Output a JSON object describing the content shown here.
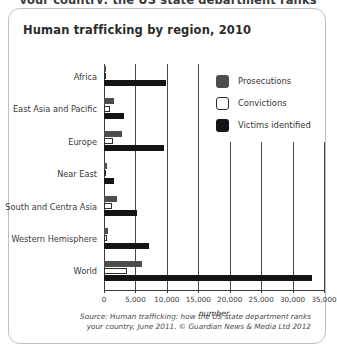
{
  "top_clipped_text": "your country: the US state department ranks",
  "card": {
    "title": "Human trafficking by region, 2010",
    "source_line1": "Source: Human trafficking: how the US state department ranks",
    "source_line2": "your country, June 2011. © Guardian News & Media Ltd 2012"
  },
  "legend": {
    "items": [
      {
        "label": "Prosecutions",
        "swatch": "prosecutions-swatch",
        "color": "#4d4d4d"
      },
      {
        "label": "Convictions",
        "swatch": "convictions-swatch",
        "color": "#ffffff"
      },
      {
        "label": "Victims identified",
        "swatch": "victims-swatch",
        "color": "#141414"
      }
    ]
  },
  "chart_data": {
    "type": "bar",
    "orientation": "horizontal",
    "title": "Human trafficking by region, 2010",
    "xlabel": "number",
    "ylabel": "",
    "xlim": [
      0,
      35000
    ],
    "xticks": [
      0,
      5000,
      10000,
      15000,
      20000,
      25000,
      30000,
      35000
    ],
    "xticklabels": [
      "0",
      "5,000",
      "10,000",
      "15,000",
      "20,000",
      "25,000",
      "30,000",
      "35,000"
    ],
    "grid": true,
    "legend_position": "upper right (inside plot)",
    "categories": [
      "Africa",
      "East Asia and Pacific",
      "Europe",
      "Near East",
      "South and Centra Asia",
      "Western Hemisphere",
      "World"
    ],
    "series": [
      {
        "name": "Prosecutions",
        "color": "#4d4d4d",
        "values": [
          270,
          1600,
          2900,
          400,
          2000,
          600,
          6000
        ]
      },
      {
        "name": "Convictions",
        "color": "#ffffff",
        "values": [
          130,
          1000,
          1500,
          250,
          1200,
          400,
          3600
        ]
      },
      {
        "name": "Victims identified",
        "color": "#141414",
        "values": [
          9900,
          3200,
          9500,
          1600,
          5300,
          7200,
          33100
        ]
      }
    ]
  }
}
